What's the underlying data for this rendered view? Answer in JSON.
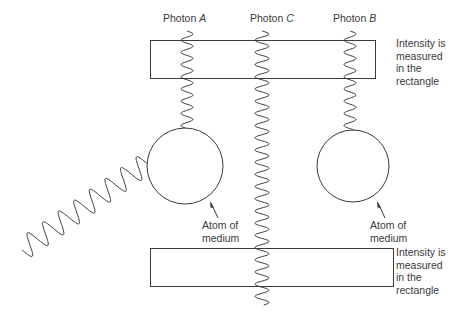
{
  "diagram": {
    "photons": [
      {
        "id": "A",
        "prefix": "Photon",
        "letter": "A"
      },
      {
        "id": "C",
        "prefix": "Photon",
        "letter": "C"
      },
      {
        "id": "B",
        "prefix": "Photon",
        "letter": "B"
      }
    ],
    "measurement_label_top": [
      "Intensity is",
      "measured",
      "in the",
      "rectangle"
    ],
    "measurement_label_bottom": [
      "Intensity is",
      "measured",
      "in the",
      "rectangle"
    ],
    "atom_label_left": [
      "Atom of",
      "medium"
    ],
    "atom_label_right": [
      "Atom of",
      "medium"
    ],
    "colors": {
      "stroke": "#3a3a3a",
      "background": "#ffffff"
    }
  }
}
